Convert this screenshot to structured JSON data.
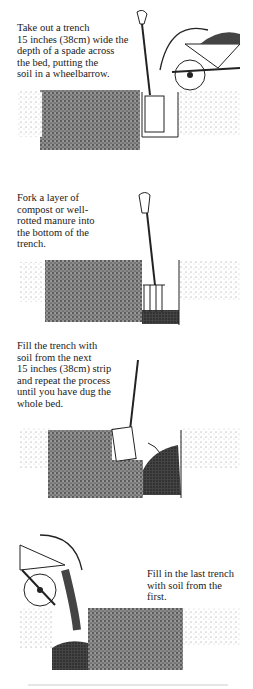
{
  "steps": [
    {
      "text": "Take out a trench\n15 inches (38cm) wide the\ndepth of a spade across\nthe bed, putting the\nsoil in a wheelbarrow."
    },
    {
      "text": "Fork a layer of\ncompost or well-\nrotted manure into\nthe bottom of the\ntrench."
    },
    {
      "text": "Fill the trench with\nsoil from the next\n15 inches (38cm) strip\nand repeat the process\nuntil you have dug the\nwhole bed."
    },
    {
      "text": "Fill in the last trench\nwith soil from the\nfirst."
    }
  ],
  "colors": {
    "ink": "#1a1a1a",
    "soil": "#555555",
    "soil_light": "#bdbdbd",
    "paper": "#ffffff"
  }
}
